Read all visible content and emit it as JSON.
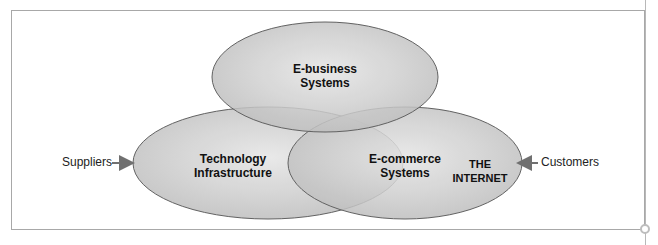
{
  "diagram": {
    "type": "venn",
    "sets": [
      {
        "id": "top",
        "label_line1": "E-business",
        "label_line2": "Systems"
      },
      {
        "id": "left",
        "label_line1": "Technology",
        "label_line2": "Infrastructure"
      },
      {
        "id": "right",
        "label_line1": "E-commerce",
        "label_line2": "Systems"
      }
    ],
    "internet_label": "THE INTERNET",
    "inputs": {
      "left": "Suppliers",
      "right": "Customers"
    },
    "colors": {
      "fill_light": "#e6e6e6",
      "fill_dark": "#a9a9a9",
      "stroke": "#5a5a5a",
      "arrow": "#707070"
    }
  }
}
